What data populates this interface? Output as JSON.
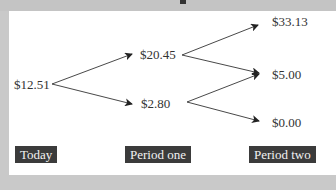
{
  "diagram": {
    "type": "binomial-tree",
    "nodes": {
      "today": "$12.51",
      "period_one_up": "$20.45",
      "period_one_down": "$2.80",
      "period_two_upup": "$33.13",
      "period_two_middle": "$5.00",
      "period_two_downdown": "$0.00"
    },
    "periods": [
      "Today",
      "Period one",
      "Period two"
    ],
    "edges": [
      [
        "$12.51",
        "$20.45"
      ],
      [
        "$12.51",
        "$2.80"
      ],
      [
        "$20.45",
        "$33.13"
      ],
      [
        "$20.45",
        "$5.00"
      ],
      [
        "$2.80",
        "$5.00"
      ],
      [
        "$2.80",
        "$0.00"
      ]
    ],
    "colors": {
      "border": "#c9c9c9",
      "panel": "#ffffff",
      "label_bg": "#3b3b3b",
      "label_text": "#f2f2f2",
      "text": "#333333"
    }
  }
}
